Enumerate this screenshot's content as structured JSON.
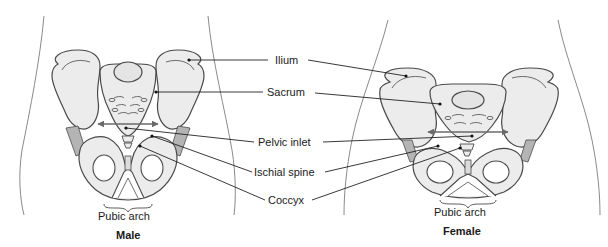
{
  "figure": {
    "panels": [
      {
        "id": "male",
        "title": "Male",
        "subtitle": "Pubic arch"
      },
      {
        "id": "female",
        "title": "Female",
        "subtitle": "Pubic arch"
      }
    ],
    "labels": [
      {
        "id": "ilium",
        "text": "Ilium"
      },
      {
        "id": "sacrum",
        "text": "Sacrum"
      },
      {
        "id": "pelvic-inlet",
        "text": "Pelvic inlet"
      },
      {
        "id": "ischial-spine",
        "text": "Ischial spine"
      },
      {
        "id": "coccyx",
        "text": "Coccyx"
      }
    ],
    "colors": {
      "bone_fill": "#ececec",
      "bone_stroke": "#4a4a4a",
      "cartilage_fill": "#b4b4b4",
      "body_outline": "#8a8a8a",
      "leader_line": "#222222",
      "arrow": "#6a6a6a"
    }
  }
}
